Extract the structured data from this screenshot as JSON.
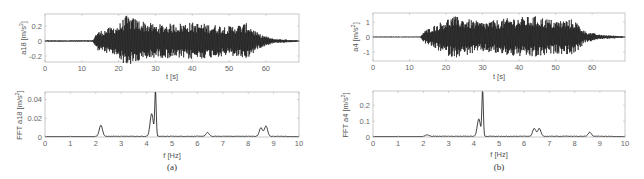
{
  "chart_data": [
    {
      "id": "a_top",
      "panel": "(a)",
      "type": "line",
      "title": "",
      "xlabel": "t [s]",
      "ylabel": "a18 [m/s^2]",
      "xlim": [
        0,
        69
      ],
      "ylim": [
        -0.28,
        0.36
      ],
      "xticks": [
        0,
        10,
        20,
        30,
        40,
        50,
        60
      ],
      "yticks": [
        -0.2,
        0,
        0.2
      ],
      "grid": false,
      "description": "acceleration time history; quiet until ~14 s, strong vibration ~14-58 s (peaks ~0.34), decays after ~58 s",
      "envelope": {
        "t": [
          0,
          13,
          14,
          20,
          22,
          30,
          40,
          50,
          55,
          58,
          62,
          69
        ],
        "amp": [
          0.01,
          0.01,
          0.12,
          0.22,
          0.34,
          0.22,
          0.25,
          0.2,
          0.24,
          0.1,
          0.03,
          0.01
        ]
      }
    },
    {
      "id": "a_bottom",
      "panel": "(a)",
      "type": "line",
      "xlabel": "f [Hz]",
      "ylabel": "FFT a18 [m/s^2]",
      "xlim": [
        0,
        10
      ],
      "ylim": [
        0,
        0.048
      ],
      "xticks": [
        0,
        1,
        2,
        3,
        4,
        5,
        6,
        7,
        8,
        9,
        10
      ],
      "yticks": [
        0,
        0.02,
        0.04
      ],
      "grid": false,
      "peaks": [
        {
          "f": 2.2,
          "amp": 0.012
        },
        {
          "f": 4.2,
          "amp": 0.024
        },
        {
          "f": 4.35,
          "amp": 0.048
        },
        {
          "f": 6.4,
          "amp": 0.004
        },
        {
          "f": 8.5,
          "amp": 0.009
        },
        {
          "f": 8.7,
          "amp": 0.011
        }
      ]
    },
    {
      "id": "b_top",
      "panel": "(b)",
      "type": "line",
      "xlabel": "t [s]",
      "ylabel": "a4 [m/s^2]",
      "xlim": [
        0,
        69
      ],
      "ylim": [
        -1.6,
        1.6
      ],
      "xticks": [
        0,
        10,
        20,
        30,
        40,
        50,
        60
      ],
      "yticks": [
        -1,
        0,
        1
      ],
      "grid": false,
      "description": "acceleration time history; quiet until ~13 s, strong vibration ~14-58 s (peaks ~1.4), decays after ~58 s",
      "envelope": {
        "t": [
          0,
          13,
          14,
          20,
          22,
          30,
          38,
          45,
          50,
          55,
          58,
          62,
          69
        ],
        "amp": [
          0.03,
          0.03,
          0.4,
          1.2,
          1.4,
          1.0,
          1.3,
          1.4,
          1.1,
          1.2,
          0.4,
          0.15,
          0.05
        ]
      }
    },
    {
      "id": "b_bottom",
      "panel": "(b)",
      "type": "line",
      "xlabel": "f [Hz]",
      "ylabel": "FFT a4 [m/s^2]",
      "xlim": [
        0,
        10
      ],
      "ylim": [
        0,
        0.29
      ],
      "xticks": [
        0,
        1,
        2,
        3,
        4,
        5,
        6,
        7,
        8,
        9,
        10
      ],
      "yticks": [
        0,
        0.1,
        0.2
      ],
      "grid": false,
      "peaks": [
        {
          "f": 2.15,
          "amp": 0.01
        },
        {
          "f": 4.2,
          "amp": 0.11
        },
        {
          "f": 4.35,
          "amp": 0.29
        },
        {
          "f": 6.4,
          "amp": 0.05
        },
        {
          "f": 6.6,
          "amp": 0.05
        },
        {
          "f": 8.6,
          "amp": 0.025
        }
      ]
    }
  ],
  "labels": {
    "a_top_x": "t [s]",
    "a_top_y": "a18 [m/s",
    "a_bot_x": "f [Hz]",
    "a_bot_y": "FFT a18 [m/s",
    "b_top_x": "t [s]",
    "b_top_y": "a4 [m/s",
    "b_bot_x": "f [Hz]",
    "b_bot_y": "FFT a4 [m/s",
    "sup": "2",
    "close": "]",
    "caption_a": "(a)",
    "caption_b": "(b)"
  },
  "ticks": {
    "time_x": [
      "0",
      "10",
      "20",
      "30",
      "40",
      "50",
      "60"
    ],
    "freq_x": [
      "0",
      "1",
      "2",
      "3",
      "4",
      "5",
      "6",
      "7",
      "8",
      "9",
      "10"
    ],
    "a_top_y": [
      "0.2",
      "0",
      "-0.2"
    ],
    "a_bot_y": [
      "0.04",
      "0.02",
      "0"
    ],
    "b_top_y": [
      "1",
      "0",
      "-1"
    ],
    "b_bot_y": [
      "0.2",
      "0.1",
      "0"
    ]
  }
}
